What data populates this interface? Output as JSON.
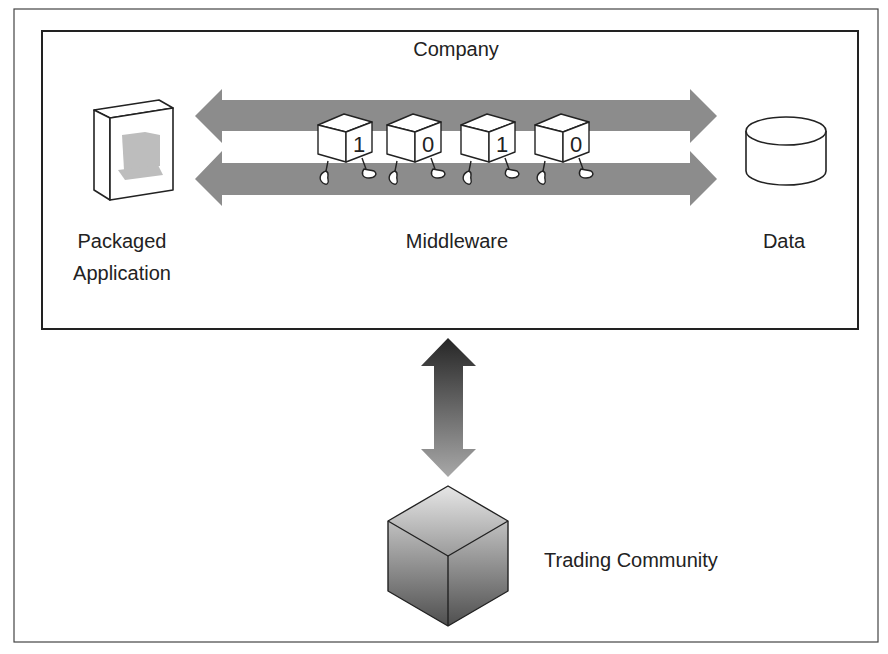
{
  "diagram": {
    "company_label": "Company",
    "packaged_app_label_line1": "Packaged",
    "packaged_app_label_line2": "Application",
    "middleware_label": "Middleware",
    "data_label": "Data",
    "trading_community_label": "Trading Community",
    "bits": [
      "1",
      "0",
      "1",
      "0"
    ]
  },
  "icons": {
    "packaged_app": "software-box-icon",
    "data": "database-cylinder-icon",
    "middleware_bits": "walking-bit-cube-icon",
    "trading_community": "cube-icon",
    "middleware_flow": "double-headed-arrow",
    "exchange_flow": "vertical-double-headed-arrow"
  },
  "colors": {
    "arrow_gray": "#8c8c8c",
    "outline": "#222222",
    "box_screen_gray": "#bdbdbd"
  }
}
